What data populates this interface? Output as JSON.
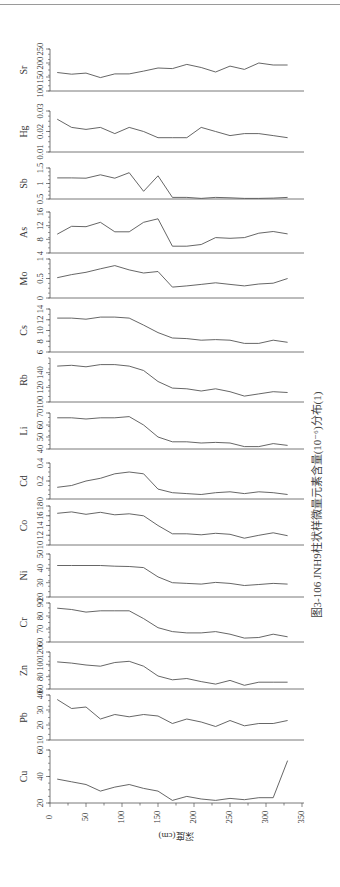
{
  "caption": "图3-106  JNH9柱状样微量元素含量(10⁻⁶)分布(1)",
  "chart_data": {
    "type": "line",
    "title": "图3-106 JNH9柱状样微量元素含量(10⁻⁶)分布(1)",
    "orientation": "rotated 90° (depth axis horizontal at bottom, panels stacked)",
    "xlabel": "深度(cm)",
    "xlim": [
      0,
      350
    ],
    "xticks": [
      0,
      50,
      100,
      150,
      200,
      250,
      300,
      350
    ],
    "x": [
      10,
      30,
      50,
      70,
      90,
      110,
      130,
      150,
      170,
      190,
      210,
      230,
      250,
      270,
      290,
      310,
      330
    ],
    "grid": false,
    "series": [
      {
        "name": "Sr",
        "ylim": [
          100,
          250
        ],
        "yticks": [
          100,
          150,
          200,
          250
        ],
        "values": [
          166,
          160,
          164,
          148,
          161,
          161,
          171,
          182,
          180,
          195,
          184,
          168,
          189,
          177,
          200,
          193,
          193
        ]
      },
      {
        "name": "Hg",
        "ylim": [
          0.01,
          0.03
        ],
        "yticks": [
          0.01,
          0.02,
          0.03
        ],
        "values": [
          0.026,
          0.022,
          0.021,
          0.022,
          0.019,
          0.022,
          0.02,
          0.017,
          0.017,
          0.017,
          0.022,
          0.02,
          0.018,
          0.019,
          0.019,
          0.018,
          0.017
        ]
      },
      {
        "name": "Sb",
        "ylim": [
          0.5,
          1.5
        ],
        "yticks": [
          0.5,
          1,
          1.5
        ],
        "values": [
          1.18,
          1.18,
          1.17,
          1.28,
          1.17,
          1.35,
          0.75,
          1.25,
          0.55,
          0.55,
          0.52,
          0.55,
          0.54,
          0.52,
          0.52,
          0.53,
          0.55
        ]
      },
      {
        "name": "As",
        "ylim": [
          4,
          16
        ],
        "yticks": [
          4,
          8,
          12,
          16
        ],
        "values": [
          9.5,
          11.8,
          11.7,
          13,
          10.2,
          10.2,
          13,
          14,
          6,
          6,
          6.5,
          8.5,
          8.3,
          8.5,
          9.8,
          10.3,
          9.6
        ]
      },
      {
        "name": "Mo",
        "ylim": [
          0,
          1
        ],
        "yticks": [
          0,
          0.5,
          1
        ],
        "values": [
          0.52,
          0.6,
          0.66,
          0.75,
          0.83,
          0.72,
          0.64,
          0.68,
          0.28,
          0.31,
          0.35,
          0.39,
          0.35,
          0.31,
          0.36,
          0.38,
          0.5
        ]
      },
      {
        "name": "Cs",
        "ylim": [
          6,
          14
        ],
        "yticks": [
          6,
          8,
          10,
          12,
          14
        ],
        "values": [
          12.3,
          12.3,
          12.1,
          12.5,
          12.5,
          12.3,
          11,
          9.6,
          8.6,
          8.5,
          8.2,
          8.3,
          8.2,
          7.6,
          7.6,
          8.2,
          7.8
        ]
      },
      {
        "name": "Rb",
        "ylim": [
          100,
          160
        ],
        "yticks": [
          100,
          120,
          140
        ],
        "values": [
          149,
          150,
          148,
          151,
          151,
          149,
          143,
          128,
          119,
          118,
          115,
          118,
          114,
          108,
          111,
          114,
          113
        ]
      },
      {
        "name": "Li",
        "ylim": [
          40,
          70
        ],
        "yticks": [
          40,
          50,
          60,
          70
        ],
        "values": [
          66,
          66,
          65,
          66,
          66,
          67,
          60,
          50,
          46,
          46,
          45,
          45.5,
          45,
          42,
          42,
          44.5,
          43
        ]
      },
      {
        "name": "Cd",
        "ylim": [
          0,
          0.4
        ],
        "yticks": [
          0,
          0.2,
          0.4
        ],
        "values": [
          0.13,
          0.15,
          0.2,
          0.23,
          0.28,
          0.3,
          0.28,
          0.11,
          0.07,
          0.06,
          0.05,
          0.07,
          0.08,
          0.06,
          0.08,
          0.07,
          0.05
        ]
      },
      {
        "name": "Co",
        "ylim": [
          10,
          18
        ],
        "yticks": [
          10,
          12,
          14,
          16,
          18
        ],
        "values": [
          16.5,
          16.8,
          16.3,
          16.7,
          16.2,
          16.4,
          16,
          14,
          12.3,
          12.3,
          12.1,
          12.4,
          12.2,
          11.4,
          12,
          12.5,
          11.9
        ]
      },
      {
        "name": "Ni",
        "ylim": [
          20,
          50
        ],
        "yticks": [
          20,
          30,
          40,
          50
        ],
        "values": [
          42,
          42,
          42,
          42,
          41.5,
          41.3,
          40.5,
          34,
          30,
          29.5,
          29,
          30.2,
          29.5,
          28,
          28.7,
          29.5,
          29
        ]
      },
      {
        "name": "Cr",
        "ylim": [
          60,
          90
        ],
        "yticks": [
          60,
          70,
          80,
          90
        ],
        "values": [
          86,
          85,
          83,
          84,
          84,
          84,
          78,
          71,
          68,
          67,
          67,
          68,
          66,
          63,
          63.5,
          66,
          64
        ]
      },
      {
        "name": "Zn",
        "ylim": [
          60,
          120
        ],
        "yticks": [
          60,
          80,
          100,
          120
        ],
        "values": [
          104,
          102,
          99,
          97,
          103,
          105,
          97,
          81,
          75,
          77,
          72,
          68,
          74,
          66,
          71,
          71,
          71
        ]
      },
      {
        "name": "Pb",
        "ylim": [
          10,
          40
        ],
        "yticks": [
          10,
          20,
          30,
          40
        ],
        "values": [
          37,
          31,
          32,
          24,
          27,
          25.5,
          27,
          26,
          21,
          24,
          22,
          19,
          23,
          19.5,
          21,
          21,
          23
        ]
      },
      {
        "name": "Cu",
        "ylim": [
          20,
          60
        ],
        "yticks": [
          20,
          40,
          60
        ],
        "values": [
          38,
          36,
          34,
          29,
          32,
          34,
          31,
          29,
          22,
          25,
          23,
          22,
          23.5,
          22.5,
          24,
          24,
          52
        ]
      }
    ]
  },
  "layout": {
    "x0px": 50,
    "x350px": 302,
    "panels": [
      {
        "top": 49,
        "bottom": 91
      },
      {
        "top": 111,
        "bottom": 152
      },
      {
        "top": 168,
        "bottom": 199
      },
      {
        "top": 212,
        "bottom": 253
      },
      {
        "top": 259,
        "bottom": 298
      },
      {
        "top": 309,
        "bottom": 352
      },
      {
        "top": 358,
        "bottom": 402
      },
      {
        "top": 413,
        "bottom": 449
      },
      {
        "top": 463,
        "bottom": 499
      },
      {
        "top": 506,
        "bottom": 545
      },
      {
        "top": 554,
        "bottom": 597
      },
      {
        "top": 603,
        "bottom": 642
      },
      {
        "top": 652,
        "bottom": 689
      },
      {
        "top": 695,
        "bottom": 740
      },
      {
        "top": 750,
        "bottom": 803
      }
    ]
  },
  "colors": {
    "line": "#555555",
    "axis": "#555555",
    "text": "#333333"
  }
}
